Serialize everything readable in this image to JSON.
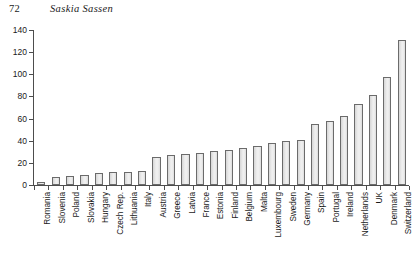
{
  "page": {
    "folio": "72",
    "running_title": "Saskia Sassen"
  },
  "chart_data": {
    "type": "bar",
    "title": "",
    "xlabel": "",
    "ylabel": "",
    "ylim": [
      0,
      140
    ],
    "ytick_values": [
      0,
      20,
      40,
      60,
      80,
      100,
      120,
      140
    ],
    "ytick_labels": [
      "0",
      "20",
      "40",
      "60",
      "80",
      "100",
      "120",
      "140"
    ],
    "grid": false,
    "legend": null,
    "bar_facecolor": "#e9e9e9",
    "bar_edgecolor": "#6b6b6b",
    "categories": [
      "Romania",
      "Slovenia",
      "Poland",
      "Slovakia",
      "Hungary",
      "Czech Rep.",
      "Lithuania",
      "Italy",
      "Austria",
      "Greece",
      "Latvia",
      "France",
      "Estonia",
      "Finland",
      "Belgium",
      "Malta",
      "Luxembourg",
      "Sweden",
      "Germany",
      "Spain",
      "Portugal",
      "Ireland",
      "Netherlands",
      "UK",
      "Denmark",
      "Switzerland"
    ],
    "values": [
      3,
      7,
      8,
      9,
      11,
      12,
      12,
      13,
      25,
      27,
      28,
      29,
      31,
      32,
      33,
      35,
      38,
      40,
      41,
      55,
      58,
      62,
      73,
      81,
      98,
      131
    ]
  }
}
